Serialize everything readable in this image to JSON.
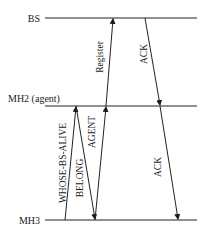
{
  "diagram": {
    "type": "sequence",
    "lifelines": [
      {
        "id": "bs",
        "label": "BS",
        "y": 18
      },
      {
        "id": "mh2",
        "label": "MH2 (agent)",
        "y": 106
      },
      {
        "id": "mh3",
        "label": "MH3",
        "y": 220
      }
    ],
    "messages": [
      {
        "id": "whose-bs-alive",
        "label": "WHOSE-BS-ALIVE",
        "from": "mh3",
        "to": "mh2",
        "x1": 65,
        "y1": 220,
        "x2": 76,
        "y2": 106
      },
      {
        "id": "belong",
        "label": "BELONG",
        "from": "mh2",
        "to": "mh3",
        "x1": 76,
        "y1": 106,
        "x2": 95,
        "y2": 220
      },
      {
        "id": "agent",
        "label": "AGENT",
        "from": "mh3",
        "to": "mh2",
        "x1": 95,
        "y1": 220,
        "x2": 106,
        "y2": 106
      },
      {
        "id": "register",
        "label": "Register",
        "from": "mh2",
        "to": "bs",
        "x1": 106,
        "y1": 106,
        "x2": 113,
        "y2": 18
      },
      {
        "id": "ack-bs-mh2",
        "label": "ACK",
        "from": "bs",
        "to": "mh2",
        "x1": 145,
        "y1": 18,
        "x2": 160,
        "y2": 106
      },
      {
        "id": "ack-mh2-mh3",
        "label": "ACK",
        "from": "mh2",
        "to": "mh3",
        "x1": 160,
        "y1": 106,
        "x2": 178,
        "y2": 220
      }
    ]
  }
}
